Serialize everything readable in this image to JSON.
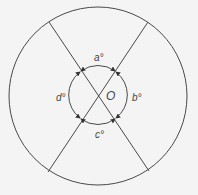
{
  "diagram": {
    "colors": {
      "background": "#f4f4f4",
      "stroke": "#4a4a4a",
      "text": "#444444"
    },
    "outer_circle": {
      "cx": 98,
      "cy": 96,
      "r": 89
    },
    "inner_circle": {
      "cx": 98,
      "cy": 95,
      "r": 29
    },
    "lines": [
      {
        "name": "line-top-left-to-bottom-right",
        "x1": 49,
        "y1": 22,
        "x2": 149,
        "y2": 171
      },
      {
        "name": "line-top-right-to-bottom-left",
        "x1": 148,
        "y1": 22,
        "x2": 48,
        "y2": 172
      }
    ],
    "labels": {
      "center": "O",
      "angle_top": "a°",
      "angle_right": "b°",
      "angle_bottom": "c°",
      "angle_left": "d°"
    }
  }
}
